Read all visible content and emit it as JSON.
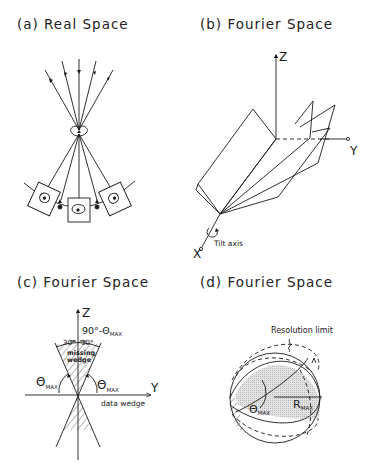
{
  "panels": [
    {
      "id": "a",
      "title": "(a) Real Space"
    },
    {
      "id": "b",
      "title": "(b) Fourier Space",
      "labels": {
        "z_axis": "Z",
        "y_axis": "Y",
        "x_axis": "X",
        "tilt_axis": "Tilt axis"
      }
    },
    {
      "id": "c",
      "title": "(c) Fourier Space",
      "labels": {
        "z_axis": "Z",
        "y_axis": "Y",
        "angle_top": "90°-Θ",
        "angle_top_sub": "MAX",
        "left_30": "30°",
        "right_30": "30°",
        "missing_wedge_1": "missing",
        "missing_wedge_2": "wedge",
        "theta_left": "Θ",
        "theta_left_sub": "MAX",
        "theta_right": "Θ",
        "theta_right_sub": "MAX",
        "data_wedge": "data wedge"
      }
    },
    {
      "id": "d",
      "title": "(d) Fourier Space",
      "labels": {
        "resolution_limit": "Resolution limit",
        "r_max": "R",
        "r_max_sub": "MAX",
        "theta": "Θ",
        "theta_sub": "MAX"
      }
    }
  ]
}
